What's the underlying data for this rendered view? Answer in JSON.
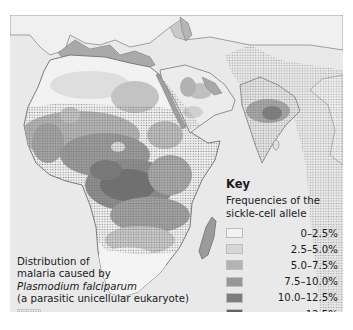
{
  "map": {
    "title": "Distribution of sickle-cell allele and falciparum malaria",
    "regions_shown": [
      "Africa",
      "Southern Europe",
      "Middle East",
      "Arabian Peninsula",
      "India",
      "Madagascar"
    ],
    "colors": {
      "background": "#e9e9e9",
      "sea": "#e8e8e8",
      "land_outline": "#7a7a7a"
    }
  },
  "key": {
    "title": "Key",
    "subtitle_line1": "Frequencies of the",
    "subtitle_line2": "sickle-cell allele",
    "items": [
      {
        "label": "0–2.5%",
        "color": "#f2f2f2"
      },
      {
        "label": "2.5–5.0%",
        "color": "#d6d6d6"
      },
      {
        "label": "5.0–7.5%",
        "color": "#b3b3b3"
      },
      {
        "label": "7.5–10.0%",
        "color": "#979797"
      },
      {
        "label": "10.0–12.5%",
        "color": "#7d7d7d"
      },
      {
        "label": ">12.5%",
        "color": "#646464"
      }
    ]
  },
  "malaria_legend": {
    "line1": "Distribution of",
    "line2": "malaria caused by",
    "line3_italic": "Plasmodium falciparum",
    "line4": "(a parasitic unicellular eukaryote)",
    "pattern": "stippled-dots"
  }
}
